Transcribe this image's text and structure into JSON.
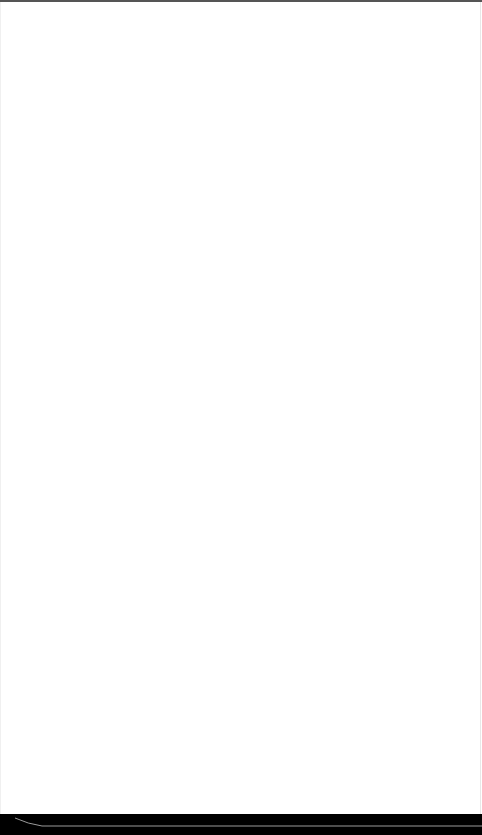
{
  "page": {
    "background": "#ffffff",
    "content": ""
  },
  "bottom_bar": {
    "background": "#000000",
    "indicator_color": "#9a9a9a"
  }
}
